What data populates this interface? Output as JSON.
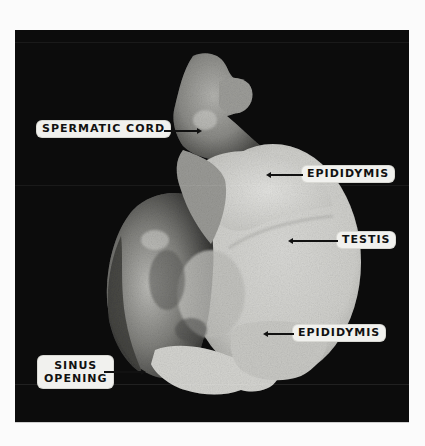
{
  "figure": {
    "type": "anatomical photograph",
    "background_color": "#0c0c0c",
    "page_color": "#fbfbfb"
  },
  "labels": [
    {
      "id": "spermatic-cord",
      "text": "SPERMATIC CORD",
      "pointer": "right"
    },
    {
      "id": "epididymis-upper",
      "text": "EPIDIDYMIS",
      "pointer": "left"
    },
    {
      "id": "testis",
      "text": "TESTIS",
      "pointer": "left"
    },
    {
      "id": "epididymis-lower",
      "text": "EPIDIDYMIS",
      "pointer": "left"
    },
    {
      "id": "sinus-opening",
      "line1": "SINUS",
      "line2": "OPENING",
      "pointer": "right"
    }
  ]
}
